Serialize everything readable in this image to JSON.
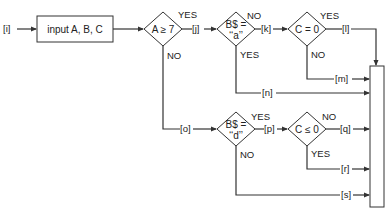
{
  "diagram": {
    "type": "flowchart",
    "start_label": "[i]",
    "input_box": {
      "text": "input A, B, C"
    },
    "decisions": [
      {
        "id": "d1",
        "line1": "A ≥ 7",
        "line2": "",
        "yes": "YES",
        "no": "NO"
      },
      {
        "id": "d2",
        "line1": "B$ =",
        "line2": "‘‘a’’",
        "yes": "YES",
        "no": "NO"
      },
      {
        "id": "d3",
        "line1": "C = 0",
        "line2": "",
        "yes": "YES",
        "no": "NO"
      },
      {
        "id": "d4",
        "line1": "B$ =",
        "line2": "‘‘d’’",
        "yes": "YES",
        "no": "NO"
      },
      {
        "id": "d5",
        "line1": "C ≤ 0",
        "line2": "",
        "yes": "YES",
        "no": "NO"
      }
    ],
    "path_labels": {
      "i": "[i]",
      "j": "[j]",
      "k": "[k]",
      "l": "[l]",
      "m": "[m]",
      "n": "[n]",
      "o": "[o]",
      "p": "[p]",
      "q": "[q]",
      "r": "[r]",
      "s": "[s]"
    },
    "collector_box": {
      "text": ""
    }
  }
}
